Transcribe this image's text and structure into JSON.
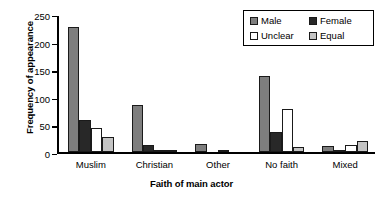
{
  "chart_data": {
    "type": "bar",
    "title": "",
    "xlabel": "Faith of main actor",
    "ylabel": "Frequency of appearance",
    "categories": [
      "Muslim",
      "Christian",
      "Other",
      "No faith",
      "Mixed"
    ],
    "series": [
      {
        "name": "Male",
        "color": "#7e7e7e",
        "values": [
          230,
          87,
          15,
          140,
          12
        ]
      },
      {
        "name": "Female",
        "color": "#282828",
        "values": [
          60,
          14,
          0,
          37,
          1
        ]
      },
      {
        "name": "Unclear",
        "color": "#ffffff",
        "values": [
          45,
          3,
          2,
          80,
          13
        ]
      },
      {
        "name": "Equal",
        "color": "#c4c4c4",
        "values": [
          28,
          2,
          0,
          10,
          21
        ]
      }
    ],
    "ylim": [
      0,
      250
    ],
    "yticks": [
      0,
      50,
      100,
      150,
      200,
      250
    ],
    "ytick_labels": [
      "0",
      "50",
      "100",
      "150",
      "200",
      "250"
    ],
    "grid": false,
    "legend_position": "top-right",
    "legend_entries": [
      "Male",
      "Female",
      "Unclear",
      "Equal"
    ]
  }
}
